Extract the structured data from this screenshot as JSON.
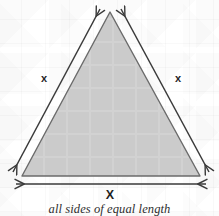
{
  "figure": {
    "caption": "all sides of equal length",
    "shape": {
      "name": "equilateral-triangle",
      "fill_color": "#cfcfcf",
      "stroke_color": "#6b6b6b",
      "apex": {
        "x": 110,
        "y": 12
      },
      "base_left": {
        "x": 22,
        "y": 176
      },
      "base_right": {
        "x": 200,
        "y": 176
      }
    },
    "labels": {
      "left_side": "x",
      "right_side": "x",
      "base": "X"
    },
    "arrows": [
      {
        "name": "left-side-measure-arrow",
        "direction": "double",
        "orientation": "diagonal-up-left"
      },
      {
        "name": "right-side-measure-arrow",
        "direction": "double",
        "orientation": "diagonal-up-right"
      },
      {
        "name": "base-measure-arrow",
        "direction": "double",
        "orientation": "horizontal"
      }
    ],
    "arrow_color": "#3a3a3a",
    "background_color": "#ffffff"
  }
}
